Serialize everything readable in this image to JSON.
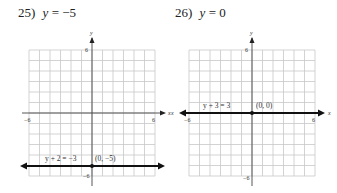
{
  "problems": [
    {
      "number": "25)",
      "equation_var": "y",
      "equation_rest": " = −5",
      "graph": {
        "x_axis_label": "x",
        "y_axis_label": "y",
        "x_min_label": "−6",
        "x_max_label": "6",
        "y_max_label": "6",
        "y_min_label": "−6",
        "line_equation_label": "y + 2 = −3",
        "point_label": "(0, −5)",
        "line_y_value": -5
      }
    },
    {
      "number": "26)",
      "equation_var": "y",
      "equation_rest": " = 0",
      "graph": {
        "x_axis_label": "x",
        "y_axis_label": "y",
        "x_min_label": "−6",
        "x_max_label": "6",
        "y_max_label": "6",
        "y_min_label": "−6",
        "line_equation_label": "y + 3 = 3",
        "point_label": "(0, 0)",
        "line_y_value": 0
      }
    }
  ],
  "colors": {
    "grid": "#c8c8c8",
    "axis": "#333333",
    "line": "#111111"
  }
}
